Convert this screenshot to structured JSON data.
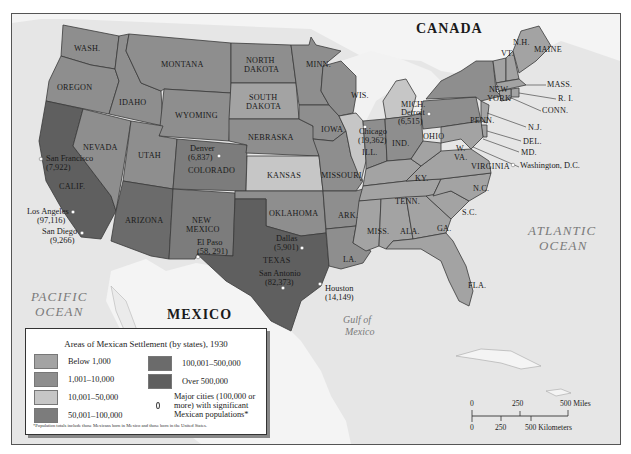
{
  "map": {
    "title": "Areas of Mexican Settlement (by states), 1930",
    "countries": [
      {
        "name": "CANADA"
      },
      {
        "name": "MEXICO"
      }
    ],
    "water_bodies": [
      {
        "name_line1": "PACIFIC",
        "name_line2": "OCEAN"
      },
      {
        "name_line1": "ATLANTIC",
        "name_line2": "OCEAN"
      },
      {
        "name_line1": "Gulf of",
        "name_line2": "Mexico"
      }
    ],
    "colors": {
      "below_1000": "#a3a3a3",
      "r1001_10000": "#8e8e8e",
      "r10001_50000": "#c6c6c6",
      "r50001_100000": "#7c7c7c",
      "r100001_500000": "#6b6b6b",
      "over_500000": "#5f5f5f",
      "water": "#e6e6e6",
      "foreign_land": "#f4f4f4"
    },
    "states": [
      {
        "label": "WASH.",
        "category": "r1001_10000"
      },
      {
        "label": "OREGON",
        "category": "r1001_10000"
      },
      {
        "label": "CALIF.",
        "category": "over_500000"
      },
      {
        "label": "IDAHO",
        "category": "r1001_10000"
      },
      {
        "label": "NEVADA",
        "category": "r1001_10000"
      },
      {
        "label": "MONTANA",
        "category": "r1001_10000"
      },
      {
        "label": "WYOMING",
        "category": "r1001_10000"
      },
      {
        "label": "UTAH",
        "category": "r1001_10000"
      },
      {
        "label": "COLORADO",
        "category": "r50001_100000"
      },
      {
        "label": "ARIZONA",
        "category": "r100001_500000"
      },
      {
        "label": "NEW",
        "label2": "MEXICO",
        "category": "r50001_100000"
      },
      {
        "label": "NORTH",
        "label2": "DAKOTA",
        "category": "r1001_10000"
      },
      {
        "label": "SOUTH",
        "label2": "DAKOTA",
        "category": "below_1000"
      },
      {
        "label": "NEBRASKA",
        "category": "r1001_10000"
      },
      {
        "label": "KANSAS",
        "category": "r10001_50000"
      },
      {
        "label": "OKLAHOMA",
        "category": "r1001_10000"
      },
      {
        "label": "TEXAS",
        "category": "over_500000"
      },
      {
        "label": "MINN.",
        "category": "r1001_10000"
      },
      {
        "label": "IOWA",
        "category": "r1001_10000"
      },
      {
        "label": "MISSOURI",
        "category": "r1001_10000"
      },
      {
        "label": "ARK.",
        "category": "r1001_10000"
      },
      {
        "label": "LA.",
        "category": "r1001_10000"
      },
      {
        "label": "WIS.",
        "category": "r1001_10000"
      },
      {
        "label": "ILL.",
        "category": "r10001_50000"
      },
      {
        "label": "MICH.",
        "category": "r10001_50000"
      },
      {
        "label": "IND.",
        "category": "r1001_10000"
      },
      {
        "label": "OHIO",
        "category": "r1001_10000"
      },
      {
        "label": "KY.",
        "category": "below_1000"
      },
      {
        "label": "TENN.",
        "category": "below_1000"
      },
      {
        "label": "MISS.",
        "category": "below_1000"
      },
      {
        "label": "ALA.",
        "category": "below_1000"
      },
      {
        "label": "GA.",
        "category": "below_1000"
      },
      {
        "label": "FLA.",
        "category": "below_1000"
      },
      {
        "label": "S.C.",
        "category": "below_1000"
      },
      {
        "label": "N.C.",
        "category": "below_1000"
      },
      {
        "label": "VIRGINIA",
        "category": "below_1000"
      },
      {
        "label": "W.",
        "label2": "VA.",
        "category": "below_1000"
      },
      {
        "label": "PENN.",
        "category": "r1001_10000"
      },
      {
        "label": "NEW",
        "label2": "YORK",
        "category": "r1001_10000"
      },
      {
        "label": "VT.",
        "category": "below_1000"
      },
      {
        "label": "N.H.",
        "category": "below_1000"
      },
      {
        "label": "MAINE",
        "category": "below_1000"
      },
      {
        "label": "MASS.",
        "category": "below_1000"
      },
      {
        "label": "R. I.",
        "category": "below_1000"
      },
      {
        "label": "CONN.",
        "category": "below_1000"
      },
      {
        "label": "N.J.",
        "category": "below_1000"
      },
      {
        "label": "DEL.",
        "category": "below_1000"
      },
      {
        "label": "MD.",
        "category": "below_1000"
      }
    ],
    "cities": [
      {
        "name": "San Francisco",
        "population": "(7,922)"
      },
      {
        "name": "Los Angeles",
        "population": "(97,116)"
      },
      {
        "name": "San Diego",
        "population": "(9,266)"
      },
      {
        "name": "Denver",
        "population": "(6,837)"
      },
      {
        "name": "El Paso",
        "population": "(58, 291)"
      },
      {
        "name": "Dallas",
        "population": "(5,901)"
      },
      {
        "name": "San Antonio",
        "population": "(82,373)"
      },
      {
        "name": "Houston",
        "population": "(14,149)"
      },
      {
        "name": "Chicago",
        "population": "(19,362)"
      },
      {
        "name": "Detroit",
        "population": "(6,515)"
      },
      {
        "name": "Washington, D.C.",
        "population": ""
      }
    ]
  },
  "legend": {
    "title": "Areas of Mexican Settlement (by states), 1930",
    "items": [
      {
        "label": "Below 1,000",
        "color": "#a3a3a3"
      },
      {
        "label": "1,001–10,000",
        "color": "#8e8e8e"
      },
      {
        "label": "10,001–50,000",
        "color": "#c6c6c6"
      },
      {
        "label": "50,001–100,000",
        "color": "#7c7c7c"
      },
      {
        "label": "100,001–500,000",
        "color": "#6b6b6b"
      },
      {
        "label": "Over 500,000",
        "color": "#5f5f5f"
      }
    ],
    "city_symbol_label": "Major cities (100,000 or more) with significant Mexican populations*",
    "footnote": "*Population totals include those Mexicans born in Mexico and those born in the United States."
  },
  "scale_bar": {
    "miles_ticks": [
      "0",
      "250",
      "500 Miles"
    ],
    "km_ticks": [
      "0",
      "250",
      "500 Kilometers"
    ]
  }
}
